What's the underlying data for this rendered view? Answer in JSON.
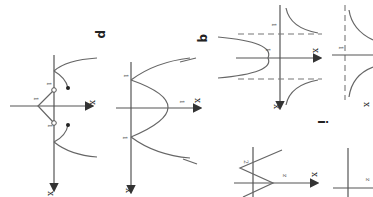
{
  "page": {
    "orientation": "rotated 90 degrees clockwise",
    "background": "#ffffff",
    "ink_color": "#555555"
  },
  "figures": [
    {
      "id": "fig-left-1",
      "description": "Graph with a V-shape cusp below the axis, two open circles and two filled dots; curve branches",
      "axis_label": "x",
      "tick_labels": [
        "1",
        "1",
        "1"
      ],
      "markers": [
        "open-circle",
        "open-circle",
        "filled-dot",
        "filled-dot"
      ]
    },
    {
      "id": "fig-left-2",
      "description": "Sideways parabola opening left with vertex on the axis",
      "label": "p",
      "axis_label": "x",
      "tick_labels": [
        "1",
        "1",
        "1"
      ]
    },
    {
      "id": "fig-right-1",
      "description": "Hyperbola-like curves with dashed asymptotes",
      "label": "q",
      "axis_label": "x",
      "tick_labels": [
        "1",
        "1"
      ]
    },
    {
      "id": "fig-right-2",
      "description": "Rational function with dashed vertical asymptote",
      "axis_label": "x",
      "tick_labels": [
        "1"
      ]
    },
    {
      "id": "fig-bottom-1",
      "description": "Angle figure with two rays forming wedge",
      "axis_label": "x",
      "tick_labels": [
        "2",
        "z"
      ],
      "label": "i"
    },
    {
      "id": "fig-bottom-2",
      "description": "Plain axes (partially visible)",
      "axis_label": "x",
      "tick_labels": [
        "z"
      ]
    }
  ],
  "labels": {
    "p": "p",
    "q": "q",
    "i": "i",
    "x": "x",
    "one": "1",
    "two": "2",
    "z": "z"
  }
}
